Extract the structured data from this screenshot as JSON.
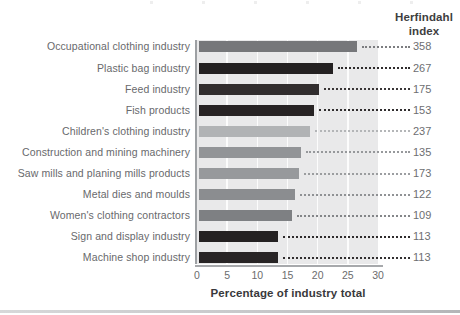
{
  "heading": {
    "line1": "Herfindahl",
    "line2": "index"
  },
  "chart_data": {
    "type": "bar",
    "orientation": "horizontal",
    "title": "",
    "xlabel": "Percentage of industry total",
    "ylabel": "",
    "right_column_header": "Herfindahl index",
    "xlim": [
      0,
      30
    ],
    "x_ticks": [
      0,
      5,
      10,
      15,
      20,
      25,
      30
    ],
    "grid": "vertical white gridlines on light gray panel",
    "categories": [
      "Occupational clothing industry",
      "Plastic bag industry",
      "Feed industry",
      "Fish products",
      "Children's clothing industry",
      "Construction and mining machinery",
      "Saw mills and planing mills products",
      "Metal dies and moulds",
      "Women's clothing contractors",
      "Sign and display industry",
      "Machine shop industry"
    ],
    "values": [
      26.5,
      22.6,
      20.3,
      19.4,
      18.7,
      17.3,
      16.9,
      16.3,
      15.8,
      13.5,
      13.4
    ],
    "herfindahl_index": [
      358,
      267,
      175,
      153,
      237,
      135,
      173,
      122,
      109,
      113,
      113
    ],
    "bar_colors": [
      "#76777a",
      "#242122",
      "#312d2e",
      "#272324",
      "#b1b3b5",
      "#929497",
      "#97999c",
      "#8b8d90",
      "#7e8083",
      "#242122",
      "#282526"
    ],
    "colors": {
      "plot_background": "#e9e9ea",
      "axis_line": "#a7a9ac",
      "category_label": "#68696c",
      "tick_label": "#6b6c6e",
      "value_label": "#6d6e71",
      "heading_text": "#3e3e40",
      "x_title_text": "#39393b"
    }
  }
}
